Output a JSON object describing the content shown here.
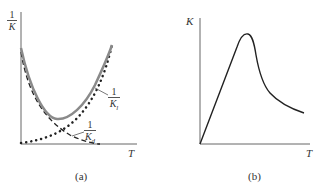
{
  "panels": [
    {
      "id": "a",
      "caption": "(a)",
      "y_axis_label": {
        "num": "1",
        "den": "K"
      },
      "x_axis_label": "T",
      "curves": [
        {
          "name": "1/K_l",
          "label_num": "1",
          "label_den": "K",
          "label_sub": "l",
          "style": "solid-gray"
        },
        {
          "name": "1/K_d",
          "label_num": "1",
          "label_den": "K",
          "label_sub": "d",
          "style": "dashed"
        },
        {
          "name": "rising",
          "style": "dotted"
        }
      ]
    },
    {
      "id": "b",
      "caption": "(b)",
      "y_axis_label": "K",
      "x_axis_label": "T",
      "curves": [
        {
          "name": "K",
          "style": "solid"
        }
      ]
    }
  ],
  "colors": {
    "axis": "#555555",
    "curve_gray": "#8a8a8a",
    "curve_dark": "#222222"
  }
}
